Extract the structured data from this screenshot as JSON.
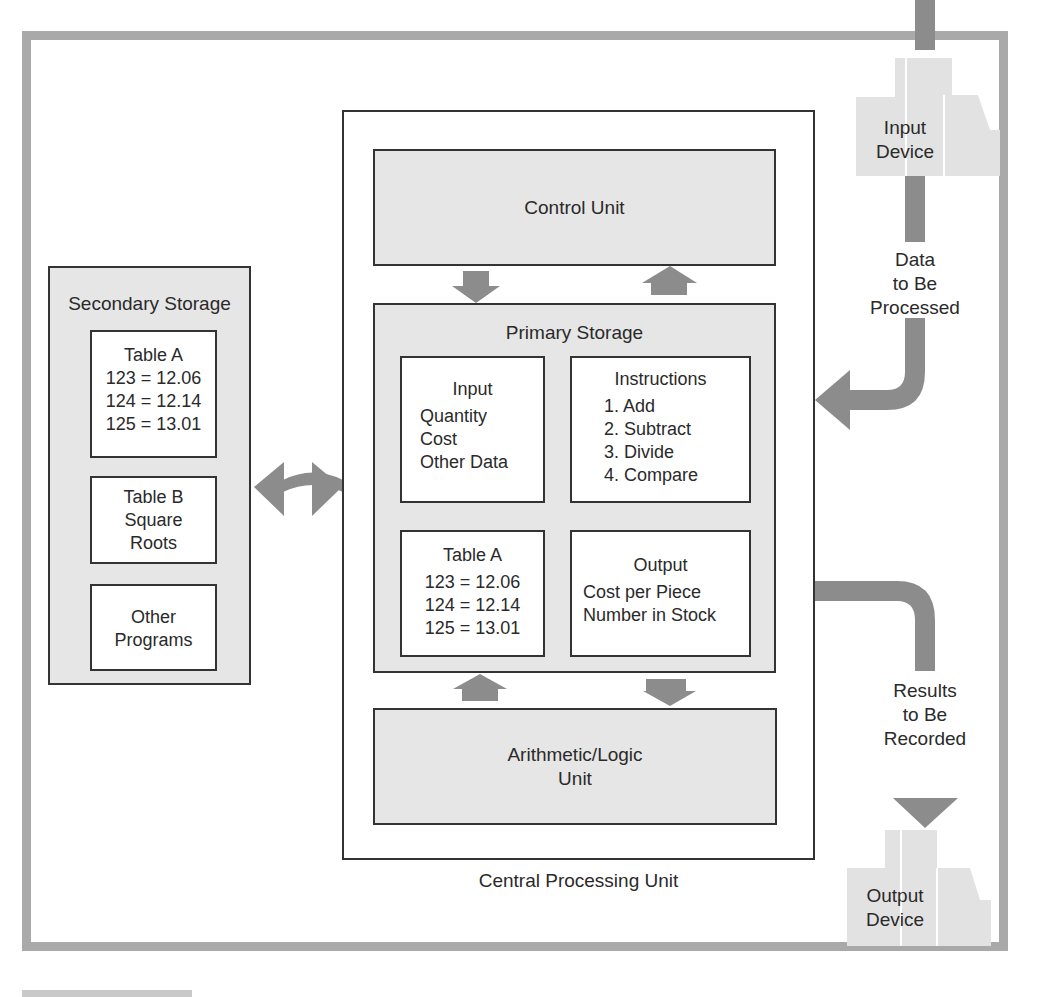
{
  "diagram": {
    "title": "Central Processing Unit",
    "colors": {
      "frame": "#a9a9a9",
      "shaded_box": "#e6e6e6",
      "arrow": "#8c8c8c",
      "device": "#e2e2e2",
      "line": "#333333"
    },
    "input_device": {
      "label_line1": "Input",
      "label_line2": "Device"
    },
    "input_flow": {
      "line1": "Data",
      "line2": "to Be",
      "line3": "Processed"
    },
    "output_device": {
      "label_line1": "Output",
      "label_line2": "Device"
    },
    "output_flow": {
      "line1": "Results",
      "line2": "to Be",
      "line3": "Recorded"
    },
    "secondary_storage": {
      "title": "Secondary Storage",
      "table_a": {
        "title": "Table A",
        "rows": [
          "123 = 12.06",
          "124 = 12.14",
          "125 = 13.01"
        ]
      },
      "table_b": {
        "title": "Table B",
        "line1": "Square",
        "line2": "Roots"
      },
      "other": {
        "line1": "Other",
        "line2": "Programs"
      }
    },
    "cpu": {
      "label": "Central Processing Unit",
      "control_unit": {
        "label": "Control Unit"
      },
      "primary_storage": {
        "title": "Primary Storage",
        "input": {
          "title": "Input",
          "items": [
            "Quantity",
            "Cost",
            "Other Data"
          ]
        },
        "instructions": {
          "title": "Instructions",
          "items": [
            "1. Add",
            "2. Subtract",
            "3. Divide",
            "4. Compare"
          ]
        },
        "table_a": {
          "title": "Table A",
          "rows": [
            "123 = 12.06",
            "124 = 12.14",
            "125 = 13.01"
          ]
        },
        "output": {
          "title": "Output",
          "items": [
            "Cost per Piece",
            "Number in Stock"
          ]
        }
      },
      "alu": {
        "line1": "Arithmetic/Logic",
        "line2": "Unit"
      }
    },
    "icons": {
      "bidirectional": "curved-double-arrow",
      "flow": "block-arrow"
    }
  }
}
